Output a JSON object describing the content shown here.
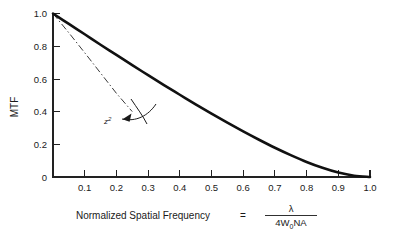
{
  "chart_data": {
    "type": "line",
    "title": "",
    "xlabel": "Normalized Spatial Frequency = λ / 4W₀NA",
    "ylabel": "MTF",
    "xlim": [
      0,
      1.0
    ],
    "ylim": [
      0,
      1.0
    ],
    "grid": false,
    "legend": "none",
    "xticks": [
      0,
      0.1,
      0.2,
      0.3,
      0.4,
      0.5,
      0.6,
      0.7,
      0.8,
      0.9,
      1.0
    ],
    "xticklabels": [
      "",
      "0.1",
      "0.2",
      "0.3",
      "0.4",
      "0.5",
      "0.6",
      "0.7",
      "0.8",
      "0.9",
      "1.0"
    ],
    "yticks": [
      0,
      0.2,
      0.4,
      0.6,
      0.8,
      1.0
    ],
    "yticklabels": [
      "0",
      "0.2",
      "0.4",
      "0.6",
      "0.8",
      "1.0"
    ],
    "series": [
      {
        "name": "diffraction-limited-mtf",
        "style": "solid",
        "linewidth": "thick",
        "color": "#111111",
        "x": [
          0.0,
          0.05,
          0.1,
          0.15,
          0.2,
          0.25,
          0.3,
          0.35,
          0.4,
          0.45,
          0.5,
          0.55,
          0.6,
          0.65,
          0.7,
          0.75,
          0.8,
          0.85,
          0.9,
          0.95,
          1.0
        ],
        "y": [
          1.0,
          0.936,
          0.873,
          0.809,
          0.747,
          0.684,
          0.623,
          0.562,
          0.503,
          0.444,
          0.387,
          0.332,
          0.279,
          0.228,
          0.179,
          0.134,
          0.092,
          0.056,
          0.027,
          0.008,
          0.0
        ]
      },
      {
        "name": "defocus-z-squared",
        "style": "dash-dot",
        "linewidth": "thin",
        "color": "#3a3a3a",
        "x": [
          0.0,
          0.05,
          0.1,
          0.15,
          0.2,
          0.25
        ],
        "y": [
          1.0,
          0.882,
          0.76,
          0.636,
          0.512,
          0.4
        ]
      }
    ],
    "annotations": [
      {
        "name": "z-squared-label",
        "text": "z",
        "superscript": "2",
        "x": 0.175,
        "y": 0.36,
        "arrow_from_x": 0.33,
        "arrow_from_y": 0.52,
        "arrow_to_x": 0.215,
        "arrow_to_y": 0.385
      }
    ]
  },
  "axis": {
    "y_label": "MTF",
    "x_label_prefix": "Normalized Spatial Frequency",
    "x_label_equals": "=",
    "x_label_numerator": "λ",
    "x_label_denominator_a": "4W",
    "x_label_denominator_sub": "0",
    "x_label_denominator_b": "NA"
  },
  "colors": {
    "background": "#ffffff",
    "foreground": "#1a1a1a",
    "curve_main": "#111111",
    "curve_dashdot": "#3a3a3a",
    "axis": "#222222"
  }
}
